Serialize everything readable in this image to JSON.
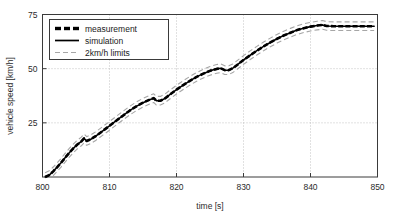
{
  "chart_data": {
    "type": "line",
    "title": "",
    "xlabel": "time [s]",
    "ylabel": "vehicle speed [km/h]",
    "xlim": [
      800,
      850
    ],
    "ylim": [
      0,
      75
    ],
    "xticks": [
      800,
      810,
      820,
      830,
      840,
      850
    ],
    "xtick_labels": [
      "800",
      "810",
      "820",
      "830",
      "840",
      "850"
    ],
    "yticks": [
      25,
      50,
      75
    ],
    "ytick_labels": [
      "25",
      "50",
      "75"
    ],
    "grid": "dotted-gray",
    "legend_position": "top-left",
    "series": [
      {
        "name": "measurement",
        "style": "dashed-thick-black",
        "color": "#000000",
        "x": [
          800.4,
          801.0,
          801.6,
          802.2,
          802.8,
          803.4,
          804.0,
          804.6,
          805.2,
          805.8,
          806.2,
          806.6,
          807.2,
          808.0,
          809.0,
          810.0,
          811.0,
          812.0,
          813.0,
          814.0,
          815.0,
          816.0,
          816.6,
          817.0,
          817.6,
          818.2,
          819.0,
          820.0,
          821.0,
          822.0,
          823.0,
          824.0,
          825.0,
          826.0,
          826.6,
          827.2,
          827.8,
          828.4,
          829.0,
          830.0,
          831.0,
          832.0,
          833.0,
          834.0,
          835.0,
          836.0,
          837.0,
          838.0,
          839.0,
          840.0,
          841.0,
          841.8,
          842.4,
          843.5,
          845.0,
          846.5,
          848.0,
          849.5
        ],
        "y": [
          0.0,
          0.9,
          2.6,
          4.6,
          6.7,
          9.0,
          11.2,
          13.2,
          15.0,
          16.4,
          17.8,
          16.6,
          17.4,
          19.0,
          21.3,
          23.6,
          26.0,
          28.3,
          30.6,
          32.6,
          34.3,
          35.7,
          36.4,
          35.2,
          35.2,
          36.1,
          38.0,
          40.3,
          42.4,
          44.4,
          46.2,
          47.7,
          49.0,
          49.9,
          50.2,
          49.3,
          49.3,
          50.2,
          51.6,
          54.0,
          56.2,
          58.3,
          60.3,
          62.1,
          63.8,
          65.3,
          66.6,
          67.8,
          68.7,
          69.4,
          69.9,
          70.2,
          69.7,
          69.6,
          69.6,
          69.6,
          69.6,
          69.6
        ]
      },
      {
        "name": "simulation",
        "style": "solid-black",
        "color": "#000000",
        "x": [
          800.4,
          801.0,
          801.6,
          802.2,
          802.8,
          803.4,
          804.0,
          804.6,
          805.2,
          805.8,
          806.2,
          806.6,
          807.2,
          808.0,
          809.0,
          810.0,
          811.0,
          812.0,
          813.0,
          814.0,
          815.0,
          816.0,
          816.6,
          817.0,
          817.6,
          818.2,
          819.0,
          820.0,
          821.0,
          822.0,
          823.0,
          824.0,
          825.0,
          826.0,
          826.6,
          827.2,
          827.8,
          828.4,
          829.0,
          830.0,
          831.0,
          832.0,
          833.0,
          834.0,
          835.0,
          836.0,
          837.0,
          838.0,
          839.0,
          840.0,
          841.0,
          841.8,
          842.4,
          843.5,
          845.0,
          846.5,
          848.0,
          849.5
        ],
        "y": [
          0.0,
          0.9,
          2.6,
          4.6,
          6.7,
          9.0,
          11.2,
          13.2,
          15.0,
          16.4,
          17.8,
          16.6,
          17.4,
          19.0,
          21.3,
          23.6,
          26.0,
          28.3,
          30.6,
          32.6,
          34.3,
          35.7,
          36.4,
          35.2,
          35.2,
          36.1,
          38.0,
          40.3,
          42.4,
          44.4,
          46.2,
          47.7,
          49.0,
          49.9,
          50.2,
          49.3,
          49.3,
          50.2,
          51.6,
          54.0,
          56.2,
          58.3,
          60.3,
          62.1,
          63.8,
          65.3,
          66.6,
          67.8,
          68.7,
          69.4,
          69.9,
          70.2,
          69.7,
          69.6,
          69.6,
          69.6,
          69.6,
          69.6
        ]
      },
      {
        "name": "2km/h limits upper",
        "style": "dashed-gray",
        "color": "#a6a6a6",
        "offset": 2.0
      },
      {
        "name": "2km/h limits lower",
        "style": "dashed-gray",
        "color": "#a6a6a6",
        "offset": -2.0
      }
    ]
  },
  "legend": {
    "items": [
      {
        "label": "measurement",
        "style": "dashed-thick-black"
      },
      {
        "label": "simulation",
        "style": "solid-black"
      },
      {
        "label": "2km/h limits",
        "style": "dashed-gray"
      }
    ]
  },
  "colors": {
    "background": "#ffffff",
    "axis": "#3a3a3a",
    "grid": "#b4b4b4",
    "data": "#000000",
    "limits": "#a6a6a6",
    "text": "#2b2b2b"
  }
}
